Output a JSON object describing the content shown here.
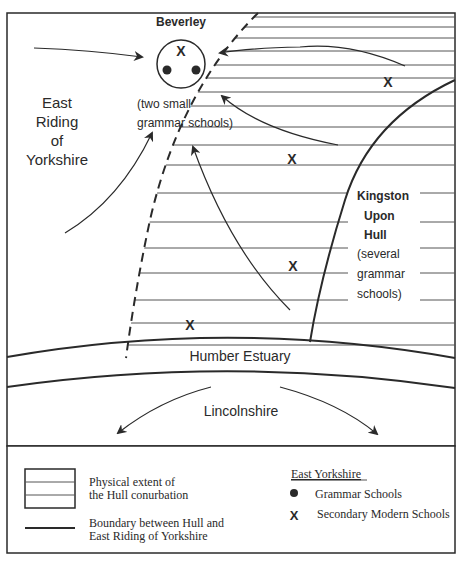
{
  "map": {
    "town": {
      "name": "Beverley",
      "note_line1": "(two small",
      "note_line2": "grammar schools)"
    },
    "region_west": {
      "line1": "East",
      "line2": "Riding",
      "line3": "of",
      "line4": "Yorkshire"
    },
    "city": {
      "line1": "Kingston",
      "line2": "Upon",
      "line3": "Hull",
      "line4": "(several",
      "line5": "grammar",
      "line6": "schools)"
    },
    "estuary": "Humber Estuary",
    "south": "Lincolnshire",
    "markers": {
      "secondary_modern_symbol": "X",
      "beverley_secondary_symbol": "X"
    }
  },
  "legend": {
    "hatch_label_line1": "Physical extent of",
    "hatch_label_line2": "the Hull conurbation",
    "boundary_label_line1": "Boundary between Hull and",
    "boundary_label_line2": "East Riding of Yorkshire",
    "key_title": "East Yorkshire",
    "grammar_label": "Grammar Schools",
    "secondary_symbol": "X",
    "secondary_label": "Secondary Modern Schools"
  },
  "colors": {
    "ink": "#2a2a2a",
    "background": "#ffffff"
  }
}
